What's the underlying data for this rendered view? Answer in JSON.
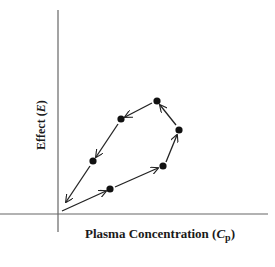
{
  "diagram": {
    "type": "hysteresis-loop",
    "x_axis": {
      "label": "Plasma Concentration (",
      "symbol": "C",
      "subscript": "p",
      "close": ")"
    },
    "y_axis": {
      "label": "Effect (",
      "symbol": "E",
      "close": ")"
    },
    "points": [
      {
        "x": 110,
        "y": 189
      },
      {
        "x": 163,
        "y": 166
      },
      {
        "x": 179,
        "y": 130
      },
      {
        "x": 157,
        "y": 101
      },
      {
        "x": 121,
        "y": 119
      },
      {
        "x": 93,
        "y": 161
      }
    ],
    "start": {
      "x": 62,
      "y": 211
    },
    "end": {
      "x": 64,
      "y": 204
    },
    "direction": "counter-clockwise",
    "colors": {
      "line": "#222222",
      "axis": "#666666",
      "point": "#111111"
    }
  }
}
